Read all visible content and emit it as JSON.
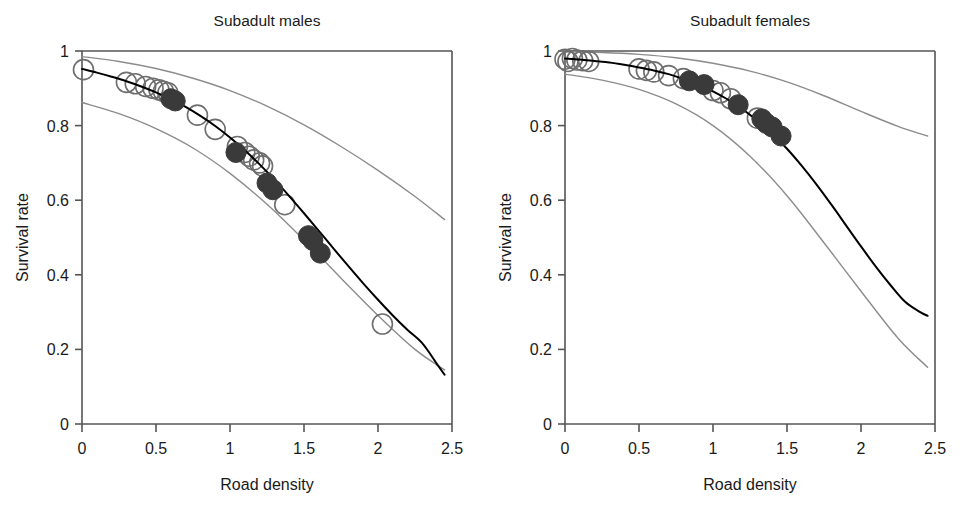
{
  "figure": {
    "background": "#ffffff",
    "panel_count": 2
  },
  "chart_data": [
    {
      "type": "scatter",
      "panel": "left",
      "title": "Subadult males",
      "xlabel": "Road density",
      "ylabel": "Survival rate",
      "xlim": [
        0,
        2.5
      ],
      "ylim": [
        0,
        1
      ],
      "xticks": [
        0,
        0.5,
        1,
        1.5,
        2,
        2.5
      ],
      "xticklabels": [
        "0",
        "0.5",
        "1",
        "1.5",
        "2",
        "2.5"
      ],
      "yticks": [
        0,
        0.2,
        0.4,
        0.6,
        0.8,
        1
      ],
      "yticklabels": [
        "0",
        "0.2",
        "0.4",
        "0.6",
        "0.8",
        "1"
      ],
      "grid": false,
      "legend": "none",
      "series": [
        {
          "name": "fitted survival curve",
          "role": "line",
          "style": "solid",
          "color": "#000000",
          "width": 2.0,
          "x": [
            0.0,
            0.1,
            0.2,
            0.3,
            0.4,
            0.5,
            0.6,
            0.7,
            0.8,
            0.9,
            1.0,
            1.1,
            1.2,
            1.3,
            1.4,
            1.5,
            1.6,
            1.7,
            1.8,
            1.9,
            2.0,
            2.1,
            2.2,
            2.3,
            2.4,
            2.45
          ],
          "values": [
            0.952,
            0.942,
            0.931,
            0.919,
            0.905,
            0.889,
            0.871,
            0.85,
            0.826,
            0.799,
            0.768,
            0.734,
            0.696,
            0.655,
            0.611,
            0.565,
            0.518,
            0.47,
            0.423,
            0.377,
            0.333,
            0.291,
            0.252,
            0.216,
            0.16,
            0.132
          ]
        },
        {
          "name": "upper confidence limit",
          "role": "line",
          "style": "solid",
          "color": "#8c8c8c",
          "width": 1.4,
          "x": [
            0.0,
            0.25,
            0.5,
            0.75,
            1.0,
            1.25,
            1.5,
            1.75,
            2.0,
            2.25,
            2.45
          ],
          "values": [
            0.985,
            0.972,
            0.953,
            0.927,
            0.894,
            0.852,
            0.802,
            0.744,
            0.68,
            0.61,
            0.548
          ]
        },
        {
          "name": "lower confidence limit",
          "role": "line",
          "style": "solid",
          "color": "#8c8c8c",
          "width": 1.4,
          "x": [
            0.0,
            0.25,
            0.5,
            0.75,
            1.0,
            1.25,
            1.5,
            1.75,
            2.0,
            2.25,
            2.45
          ],
          "values": [
            0.862,
            0.832,
            0.792,
            0.74,
            0.672,
            0.589,
            0.493,
            0.391,
            0.291,
            0.2,
            0.145
          ]
        },
        {
          "name": "open circles",
          "role": "points",
          "marker": "open-circle",
          "color": "#6e6e6e",
          "radius": 10,
          "points": [
            [
              0.01,
              0.95
            ],
            [
              0.3,
              0.916
            ],
            [
              0.36,
              0.912
            ],
            [
              0.43,
              0.905
            ],
            [
              0.48,
              0.9
            ],
            [
              0.52,
              0.896
            ],
            [
              0.55,
              0.892
            ],
            [
              0.58,
              0.888
            ],
            [
              0.78,
              0.828
            ],
            [
              0.9,
              0.79
            ],
            [
              1.05,
              0.744
            ],
            [
              1.1,
              0.728
            ],
            [
              1.13,
              0.718
            ],
            [
              1.16,
              0.708
            ],
            [
              1.2,
              0.7
            ],
            [
              1.22,
              0.692
            ],
            [
              1.37,
              0.588
            ],
            [
              2.03,
              0.268
            ]
          ]
        },
        {
          "name": "filled circles",
          "role": "points",
          "marker": "filled-circle",
          "color": "#3a3a3a",
          "radius": 10,
          "points": [
            [
              0.6,
              0.872
            ],
            [
              0.63,
              0.866
            ],
            [
              1.04,
              0.728
            ],
            [
              1.25,
              0.646
            ],
            [
              1.29,
              0.628
            ],
            [
              1.53,
              0.505
            ],
            [
              1.56,
              0.492
            ],
            [
              1.61,
              0.458
            ]
          ]
        }
      ]
    },
    {
      "type": "scatter",
      "panel": "right",
      "title": "Subadult females",
      "xlabel": "Road density",
      "ylabel": "Survival rate",
      "xlim": [
        0,
        2.5
      ],
      "ylim": [
        0,
        1
      ],
      "xticks": [
        0,
        0.5,
        1,
        1.5,
        2,
        2.5
      ],
      "xticklabels": [
        "0",
        "0.5",
        "1",
        "1.5",
        "2",
        "2.5"
      ],
      "yticks": [
        0,
        0.2,
        0.4,
        0.6,
        0.8,
        1
      ],
      "yticklabels": [
        "0",
        "0.2",
        "0.4",
        "0.6",
        "0.8",
        "1"
      ],
      "grid": false,
      "legend": "none",
      "series": [
        {
          "name": "fitted survival curve",
          "role": "line",
          "style": "solid",
          "color": "#000000",
          "width": 2.0,
          "x": [
            0.0,
            0.1,
            0.2,
            0.3,
            0.4,
            0.5,
            0.6,
            0.7,
            0.8,
            0.9,
            1.0,
            1.1,
            1.2,
            1.3,
            1.4,
            1.5,
            1.6,
            1.7,
            1.8,
            1.9,
            2.0,
            2.1,
            2.2,
            2.3,
            2.4,
            2.45
          ],
          "values": [
            0.98,
            0.977,
            0.973,
            0.969,
            0.963,
            0.956,
            0.948,
            0.938,
            0.925,
            0.91,
            0.892,
            0.87,
            0.844,
            0.813,
            0.778,
            0.738,
            0.692,
            0.642,
            0.588,
            0.532,
            0.476,
            0.422,
            0.372,
            0.327,
            0.3,
            0.29
          ]
        },
        {
          "name": "upper confidence limit",
          "role": "line",
          "style": "solid",
          "color": "#8c8c8c",
          "width": 1.4,
          "x": [
            0.0,
            0.25,
            0.5,
            0.75,
            1.0,
            1.25,
            1.5,
            1.75,
            2.0,
            2.25,
            2.45
          ],
          "values": [
            0.998,
            0.996,
            0.991,
            0.982,
            0.967,
            0.946,
            0.917,
            0.88,
            0.838,
            0.798,
            0.772
          ]
        },
        {
          "name": "lower confidence limit",
          "role": "line",
          "style": "solid",
          "color": "#8c8c8c",
          "width": 1.4,
          "x": [
            0.0,
            0.25,
            0.5,
            0.75,
            1.0,
            1.25,
            1.5,
            1.75,
            2.0,
            2.25,
            2.45
          ],
          "values": [
            0.938,
            0.922,
            0.897,
            0.858,
            0.8,
            0.718,
            0.612,
            0.486,
            0.356,
            0.23,
            0.152
          ]
        },
        {
          "name": "open circles",
          "role": "points",
          "marker": "open-circle",
          "color": "#6e6e6e",
          "radius": 10,
          "points": [
            [
              0.0,
              0.978
            ],
            [
              0.02,
              0.972
            ],
            [
              0.05,
              0.98
            ],
            [
              0.08,
              0.976
            ],
            [
              0.12,
              0.974
            ],
            [
              0.16,
              0.972
            ],
            [
              0.5,
              0.952
            ],
            [
              0.55,
              0.948
            ],
            [
              0.6,
              0.944
            ],
            [
              0.7,
              0.934
            ],
            [
              0.8,
              0.926
            ],
            [
              1.0,
              0.894
            ],
            [
              1.05,
              0.888
            ],
            [
              1.12,
              0.872
            ],
            [
              1.3,
              0.82
            ]
          ]
        },
        {
          "name": "filled circles",
          "role": "points",
          "marker": "filled-circle",
          "color": "#3a3a3a",
          "radius": 10,
          "points": [
            [
              0.84,
              0.92
            ],
            [
              0.94,
              0.91
            ],
            [
              1.17,
              0.856
            ],
            [
              1.33,
              0.818
            ],
            [
              1.36,
              0.806
            ],
            [
              1.4,
              0.796
            ],
            [
              1.46,
              0.772
            ]
          ]
        }
      ]
    }
  ]
}
